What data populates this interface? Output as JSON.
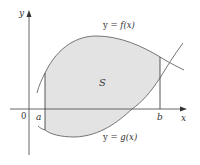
{
  "diagram": {
    "axes": {
      "x_label": "x",
      "y_label": "y",
      "origin_label": "0"
    },
    "bounds": {
      "left_label": "a",
      "right_label": "b"
    },
    "curves": {
      "upper": {
        "label_prefix": "y = ",
        "label_fn": "f(x)"
      },
      "lower": {
        "label_prefix": "y = ",
        "label_fn": "g(x)"
      }
    },
    "region": {
      "label": "S",
      "fill_color": "#e3e3e3"
    },
    "colors": {
      "axis": "#555555",
      "curve": "#666666",
      "text": "#333333"
    }
  }
}
